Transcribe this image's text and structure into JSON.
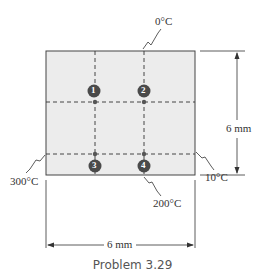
{
  "diagram": {
    "type": "2D conduction grid",
    "boundaries": {
      "top": "0°C",
      "left": "300°C",
      "right": "10°C",
      "bottom": "200°C"
    },
    "dimensions": {
      "height": "6 mm",
      "width": "6 mm"
    },
    "nodes": [
      {
        "id": "1",
        "label": "1"
      },
      {
        "id": "2",
        "label": "2"
      },
      {
        "id": "3",
        "label": "3"
      },
      {
        "id": "4",
        "label": "4"
      }
    ],
    "colors": {
      "plate_fill": "#ececec",
      "node_fill": "#4a4a4a",
      "line": "#333333"
    }
  },
  "caption": "Problem 3.29"
}
